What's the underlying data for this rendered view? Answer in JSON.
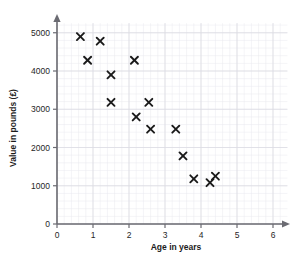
{
  "chart_data": {
    "type": "scatter",
    "title": "",
    "xlabel": "Age in years",
    "ylabel": "Value in pounds (£)",
    "xlim": [
      0,
      6.4
    ],
    "ylim": [
      0,
      5250
    ],
    "xticks": [
      0,
      1,
      2,
      3,
      4,
      5,
      6
    ],
    "yticks": [
      0,
      1000,
      2000,
      3000,
      4000,
      5000
    ],
    "xtick_labels": [
      "0",
      "1",
      "2",
      "3",
      "4",
      "5",
      "6"
    ],
    "ytick_labels": [
      "0",
      "1000",
      "2000",
      "3000",
      "4000",
      "5000"
    ],
    "grid": true,
    "grid_minor": true,
    "legend": false,
    "marker": "x",
    "marker_color": "#1a1a1a",
    "points": [
      {
        "x": 0.65,
        "y": 4900
      },
      {
        "x": 1.2,
        "y": 4780
      },
      {
        "x": 0.85,
        "y": 4280
      },
      {
        "x": 2.15,
        "y": 4280
      },
      {
        "x": 1.5,
        "y": 3900
      },
      {
        "x": 1.5,
        "y": 3180
      },
      {
        "x": 2.55,
        "y": 3180
      },
      {
        "x": 2.2,
        "y": 2800
      },
      {
        "x": 2.6,
        "y": 2480
      },
      {
        "x": 3.3,
        "y": 2480
      },
      {
        "x": 3.5,
        "y": 1780
      },
      {
        "x": 3.8,
        "y": 1180
      },
      {
        "x": 4.25,
        "y": 1080
      },
      {
        "x": 4.4,
        "y": 1250
      }
    ]
  },
  "colors": {
    "background": "#ffffff",
    "axis": "#6b6b72",
    "grid_major": "#dcdce3",
    "grid_minor": "#e9e9ee",
    "marker": "#1a1a1a",
    "text": "#262626"
  }
}
